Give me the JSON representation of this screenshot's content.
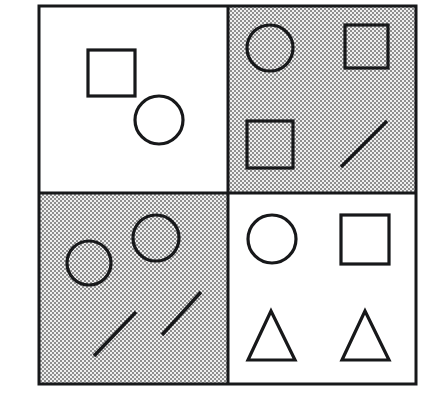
{
  "figure": {
    "canvas": {
      "width": 427,
      "height": 411,
      "background_color": "#ffffff"
    },
    "frame": {
      "x": 39,
      "y": 6,
      "width": 377,
      "height": 378,
      "stroke_color": "#17181a",
      "stroke_width": 3,
      "divider_x": 228,
      "divider_y": 193
    },
    "colors": {
      "ink": "#17181a",
      "white_fill": "#ffffff",
      "gray_fill": "#b4b4b4",
      "gray_dither_light": "#e8e8e8",
      "gray_dither_dark": "#8a8a8a"
    },
    "quadrants": [
      {
        "id": "top-left",
        "label": "Top left quadrant",
        "background": "white",
        "shape_counts": {
          "square": 1,
          "circle": 1,
          "line": 0,
          "triangle": 0
        },
        "shapes": [
          {
            "type": "square",
            "x": 88,
            "y": 50,
            "width": 47,
            "height": 46
          },
          {
            "type": "circle",
            "cx": 159,
            "cy": 120,
            "r": 24
          }
        ]
      },
      {
        "id": "top-right",
        "label": "Top right quadrant",
        "background": "gray",
        "shape_counts": {
          "square": 2,
          "circle": 1,
          "line": 1,
          "triangle": 0
        },
        "shapes": [
          {
            "type": "circle",
            "cx": 270,
            "cy": 48,
            "r": 23
          },
          {
            "type": "square",
            "x": 345,
            "y": 25,
            "width": 43,
            "height": 43
          },
          {
            "type": "square",
            "x": 247,
            "y": 121,
            "width": 46,
            "height": 47
          },
          {
            "type": "line",
            "x1": 341,
            "y1": 167,
            "x2": 387,
            "y2": 121
          }
        ]
      },
      {
        "id": "bottom-left",
        "label": "Bottom left quadrant",
        "background": "gray",
        "shape_counts": {
          "square": 0,
          "circle": 2,
          "line": 2,
          "triangle": 0
        },
        "shapes": [
          {
            "type": "circle",
            "cx": 89,
            "cy": 263,
            "r": 22
          },
          {
            "type": "circle",
            "cx": 156,
            "cy": 238,
            "r": 23
          },
          {
            "type": "line",
            "x1": 94,
            "y1": 356,
            "x2": 136,
            "y2": 312
          },
          {
            "type": "line",
            "x1": 162,
            "y1": 335,
            "x2": 201,
            "y2": 292
          }
        ]
      },
      {
        "id": "bottom-right",
        "label": "Bottom right quadrant",
        "background": "white",
        "shape_counts": {
          "square": 1,
          "circle": 1,
          "line": 0,
          "triangle": 2
        },
        "shapes": [
          {
            "type": "circle",
            "cx": 272,
            "cy": 239,
            "r": 24
          },
          {
            "type": "square",
            "x": 341,
            "y": 215,
            "width": 48,
            "height": 49
          },
          {
            "type": "triangle",
            "apex_x": 271,
            "apex_y": 311,
            "left_x": 248,
            "right_x": 295,
            "base_y": 360
          },
          {
            "type": "triangle",
            "apex_x": 365,
            "apex_y": 311,
            "left_x": 342,
            "right_x": 389,
            "base_y": 360
          }
        ]
      }
    ]
  }
}
